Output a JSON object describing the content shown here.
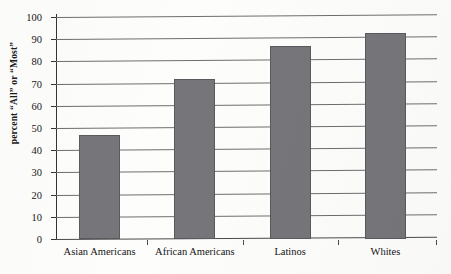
{
  "chart_data": {
    "type": "bar",
    "title": "",
    "xlabel": "",
    "ylabel": "percent “All” or “Most”",
    "categories": [
      "Asian Americans",
      "African Americans",
      "Latinos",
      "Whites"
    ],
    "values": [
      47,
      72,
      87,
      93
    ],
    "ylim": [
      0,
      100
    ],
    "yticks": [
      0,
      10,
      20,
      30,
      40,
      50,
      60,
      70,
      80,
      90,
      100
    ],
    "ytick_labels": [
      "0",
      "10",
      "20",
      "30",
      "40",
      "50",
      "60",
      "70",
      "80",
      "90",
      "100"
    ],
    "grid": true,
    "legend": false,
    "series": [
      {
        "name": "percent “All” or “Most”",
        "values": [
          47,
          72,
          87,
          93
        ],
        "color": "#76767a"
      }
    ]
  },
  "colors": {
    "bar_fill": "#76767a",
    "bar_border": "#5a5a5e",
    "gridline": "#6e6e6e",
    "axis": "#343434",
    "text": "#141414",
    "background": "#fdfdfc"
  }
}
